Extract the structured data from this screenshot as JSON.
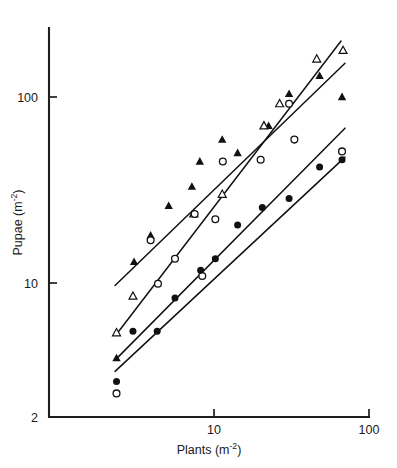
{
  "figure": {
    "background_color": "#ffffff",
    "ink_color": "#111111"
  },
  "chart_data": {
    "type": "scatter",
    "title": "",
    "subtitle": "",
    "xlabel": "Plants (m",
    "xlabel_sup": "-2",
    "xlabel_tail": ")",
    "ylabel": "Pupae (m",
    "ylabel_sup": "-2",
    "ylabel_tail": ")",
    "xscale": "log",
    "yscale": "log",
    "xlim": [
      2,
      100
    ],
    "ylim": [
      2,
      220
    ],
    "grid": false,
    "legend": "none",
    "xticks": [
      {
        "value": 10,
        "label": "10"
      },
      {
        "value": 100,
        "label": "100"
      }
    ],
    "yticks": [
      {
        "value": 2,
        "label": "2"
      },
      {
        "value": 10,
        "label": "10"
      },
      {
        "value": 100,
        "label": "100"
      }
    ],
    "axis_origin_label": "2",
    "series": [
      {
        "name": "filled-triangle",
        "marker": "filled-triangle",
        "points": [
          {
            "x": 2.35,
            "y": 3.95
          },
          {
            "x": 3.05,
            "y": 13.0
          },
          {
            "x": 3.9,
            "y": 18.0
          },
          {
            "x": 5.1,
            "y": 26.0
          },
          {
            "x": 7.2,
            "y": 33.0
          },
          {
            "x": 8.1,
            "y": 45.0
          },
          {
            "x": 11.3,
            "y": 59.0
          },
          {
            "x": 14.2,
            "y": 50.0
          },
          {
            "x": 22.5,
            "y": 70.0
          },
          {
            "x": 30.5,
            "y": 104.0
          },
          {
            "x": 48.0,
            "y": 130.0
          },
          {
            "x": 67.0,
            "y": 100.0
          }
        ],
        "fit_line": {
          "x0": 2.3,
          "y0": 9.7,
          "x1": 70.0,
          "y1": 152.0
        }
      },
      {
        "name": "open-triangle",
        "marker": "open-triangle",
        "points": [
          {
            "x": 2.35,
            "y": 5.4
          },
          {
            "x": 3.0,
            "y": 8.5
          },
          {
            "x": 7.4,
            "y": 23.5
          },
          {
            "x": 11.3,
            "y": 30.0
          },
          {
            "x": 21.0,
            "y": 70.0
          },
          {
            "x": 26.5,
            "y": 92.0
          },
          {
            "x": 46.0,
            "y": 160.0
          },
          {
            "x": 68.0,
            "y": 178.0
          }
        ],
        "fit_line": {
          "x0": 2.35,
          "y0": 5.3,
          "x1": 66.0,
          "y1": 200.0
        }
      },
      {
        "name": "open-circle",
        "marker": "open-circle",
        "points": [
          {
            "x": 2.35,
            "y": 2.55
          },
          {
            "x": 3.9,
            "y": 17.0
          },
          {
            "x": 4.35,
            "y": 9.9
          },
          {
            "x": 5.6,
            "y": 13.5
          },
          {
            "x": 7.5,
            "y": 23.5
          },
          {
            "x": 8.4,
            "y": 10.9
          },
          {
            "x": 10.2,
            "y": 22.0
          },
          {
            "x": 11.4,
            "y": 45.0
          },
          {
            "x": 20.0,
            "y": 46.0
          },
          {
            "x": 30.5,
            "y": 92.0
          },
          {
            "x": 33.0,
            "y": 59.0
          },
          {
            "x": 67.0,
            "y": 51.0
          }
        ],
        "fit_line": {
          "x0": 2.3,
          "y0": 3.85,
          "x1": 70.0,
          "y1": 68.0
        }
      },
      {
        "name": "filled-circle",
        "marker": "filled-circle",
        "points": [
          {
            "x": 2.35,
            "y": 2.95
          },
          {
            "x": 3.0,
            "y": 5.5
          },
          {
            "x": 4.3,
            "y": 5.5
          },
          {
            "x": 5.6,
            "y": 8.3
          },
          {
            "x": 8.2,
            "y": 11.7
          },
          {
            "x": 10.2,
            "y": 13.5
          },
          {
            "x": 14.2,
            "y": 20.5
          },
          {
            "x": 20.5,
            "y": 25.5
          },
          {
            "x": 30.5,
            "y": 28.5
          },
          {
            "x": 48.0,
            "y": 42.0
          },
          {
            "x": 67.0,
            "y": 46.0
          }
        ],
        "fit_line": {
          "x0": 2.3,
          "y0": 3.35,
          "x1": 70.0,
          "y1": 47.5
        }
      }
    ]
  }
}
